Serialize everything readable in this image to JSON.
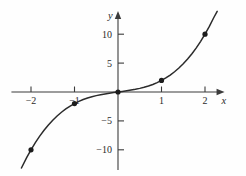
{
  "chart_data": {
    "type": "line",
    "title": "",
    "subtitle": "",
    "xlabel": "x",
    "ylabel": "y",
    "xlim": [
      -2.45,
      2.45
    ],
    "ylim": [
      -13.5,
      14.0
    ],
    "grid": false,
    "legend": null,
    "annotations": [],
    "x_ticks": [
      {
        "value": -2,
        "label": "−2"
      },
      {
        "value": -1,
        "label": "−1"
      },
      {
        "value": 1,
        "label": "1"
      },
      {
        "value": 2,
        "label": "2"
      }
    ],
    "y_ticks": [
      {
        "value": 10,
        "label": "10"
      },
      {
        "value": 5,
        "label": "5"
      },
      {
        "value": -5,
        "label": "−5"
      },
      {
        "value": -10,
        "label": "−10"
      }
    ],
    "series": [
      {
        "name": "curve",
        "kind": "line",
        "color": "#2b2b2b",
        "x": [
          -2.22,
          -2.1,
          -2.0,
          -1.9,
          -1.8,
          -1.7,
          -1.6,
          -1.5,
          -1.4,
          -1.3,
          -1.2,
          -1.1,
          -1.0,
          -0.9,
          -0.8,
          -0.7,
          -0.6,
          -0.5,
          -0.4,
          -0.3,
          -0.2,
          -0.1,
          0.0,
          0.1,
          0.2,
          0.3,
          0.4,
          0.5,
          0.6,
          0.7,
          0.8,
          0.9,
          1.0,
          1.1,
          1.2,
          1.3,
          1.4,
          1.5,
          1.6,
          1.7,
          1.8,
          1.9,
          2.0,
          2.1,
          2.2,
          2.28
        ],
        "y": [
          -13.15,
          -11.36,
          -10.0,
          -8.76,
          -7.63,
          -6.61,
          -5.7,
          -4.88,
          -4.14,
          -3.5,
          -2.93,
          -2.43,
          -2.0,
          -1.63,
          -1.31,
          -1.04,
          -0.82,
          -0.63,
          -0.46,
          -0.33,
          -0.21,
          -0.1,
          0.0,
          0.1,
          0.21,
          0.33,
          0.46,
          0.63,
          0.82,
          1.04,
          1.31,
          1.63,
          2.0,
          2.43,
          2.93,
          3.5,
          4.14,
          4.88,
          5.7,
          6.61,
          7.63,
          8.76,
          10.0,
          11.36,
          12.85,
          13.95
        ]
      },
      {
        "name": "marked-points",
        "kind": "scatter",
        "color": "#1c1c1c",
        "x": [
          -2,
          -1,
          0,
          1,
          2
        ],
        "y": [
          -10,
          -2,
          0,
          2,
          10
        ]
      }
    ]
  },
  "axes": {
    "x_axis_name": "x",
    "y_axis_name": "y"
  }
}
